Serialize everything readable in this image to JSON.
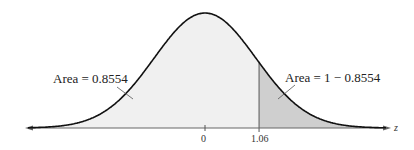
{
  "chart_data": {
    "type": "area",
    "title": "",
    "distribution": "standard normal",
    "xlabel": "z",
    "ylabel": "",
    "x_ticks": [
      {
        "value": 0,
        "label": "0"
      },
      {
        "value": 1.06,
        "label": "1.06"
      }
    ],
    "shaded_regions": [
      {
        "name": "left",
        "from": "-inf",
        "to": 1.06,
        "area": 0.8554,
        "label": "Area = 0.8554",
        "color": "#f0f0f0"
      },
      {
        "name": "right",
        "from": 1.06,
        "to": "inf",
        "area": 0.1446,
        "label": "Area = 1 − 0.8554",
        "color": "#cfcfcf"
      }
    ],
    "grid": false,
    "legend": "none",
    "colors": {
      "curve": "#111111",
      "axis": "#666666",
      "left_fill": "#f0f0f0",
      "right_fill": "#cfcfcf"
    }
  },
  "labels": {
    "left_area": "Area = 0.8554",
    "right_area": "Area = 1 − 0.8554",
    "tick_zero": "0",
    "tick_z": "1.06",
    "axis_var": "z"
  }
}
